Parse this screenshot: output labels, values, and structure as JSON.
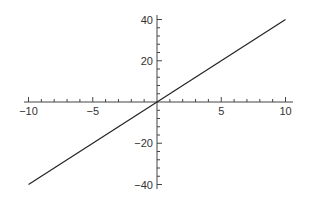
{
  "chart_data": {
    "type": "line",
    "title": "",
    "xlabel": "",
    "ylabel": "",
    "xlim": [
      -10,
      10
    ],
    "ylim": [
      -40,
      40
    ],
    "grid": false,
    "legend": null,
    "axes_style": "centered at origin",
    "x_ticks": [
      -10,
      -5,
      5,
      10
    ],
    "x_tick_labels": [
      "-10",
      "-5",
      "5",
      "10"
    ],
    "x_minor_tick_step": 1,
    "y_ticks": [
      -40,
      -20,
      20,
      40
    ],
    "y_tick_labels": [
      "-40",
      "-20",
      "20",
      "40"
    ],
    "y_minor_tick_step": 4,
    "series": [
      {
        "name": "y = 4x",
        "color": "#222222",
        "x": [
          -10,
          10
        ],
        "y": [
          -40,
          40
        ]
      }
    ]
  },
  "colors": {
    "axis": "#444444",
    "line": "#222222",
    "text": "#333333"
  }
}
